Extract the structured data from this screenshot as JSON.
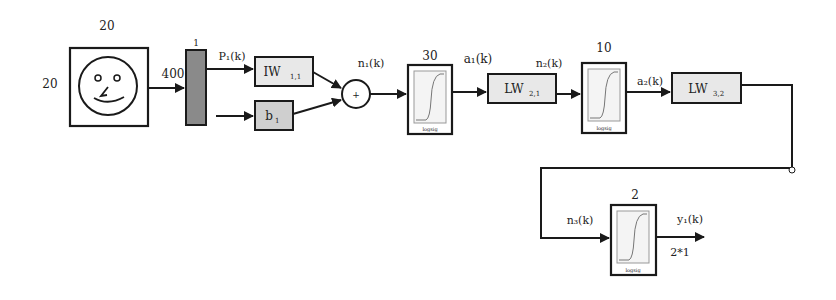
{
  "diagram": {
    "type": "neural-network-block-diagram",
    "input": {
      "image_icon": "smiley-face-icon",
      "width_label": "20",
      "height_label": "20",
      "flattened_size": "400"
    },
    "mux": {
      "label": "1"
    },
    "signals": {
      "p1": "P₁(k)",
      "n1": "n₁(k)",
      "a1": "a₁(k)",
      "n2": "n₂(k)",
      "a2": "a₂(k)",
      "n3": "n₃(k)",
      "y1": "y₁(k)"
    },
    "blocks": {
      "iw11": {
        "main": "IW",
        "sub": "1,1"
      },
      "b1": {
        "main": "b",
        "sub": "1"
      },
      "sum": {
        "symbol": "+"
      },
      "tf1": {
        "size": "30",
        "caption": "logsig"
      },
      "lw21": {
        "main": "LW",
        "sub": "2,1"
      },
      "tf2": {
        "size": "10",
        "caption": "logsig"
      },
      "lw32": {
        "main": "LW",
        "sub": "3,2"
      },
      "tf3": {
        "size": "2",
        "caption": "logsig"
      }
    },
    "output": {
      "size_label": "2*1"
    }
  },
  "colors": {
    "stroke": "#1a1a1a",
    "block_fill": "#e8e8e8",
    "mux_fill": "#8a8a8a",
    "bias_fill": "#cfcfcf",
    "tf_inner": "#f4f4f4"
  }
}
